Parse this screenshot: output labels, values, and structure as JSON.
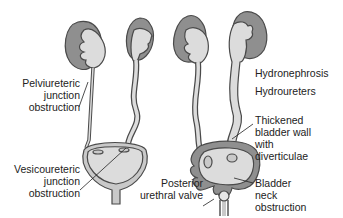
{
  "diagram": {
    "colors": {
      "cortex": "#8f8f8f",
      "pelvis": "#dcdcdc",
      "outline": "#4a4a4a",
      "text": "#222222",
      "background": "#ffffff"
    },
    "left_figure": {
      "labels": [
        {
          "id": "pui",
          "text": "Pelviureteric\njunction\nobstruction"
        },
        {
          "id": "vuj",
          "text": "Vesicoureteric\njunction\nobstruction"
        }
      ]
    },
    "right_figure": {
      "labels": [
        {
          "id": "hydronephrosis",
          "text": "Hydronephrosis"
        },
        {
          "id": "hydroureters",
          "text": "Hydroureters"
        },
        {
          "id": "thickened",
          "text": "Thickened\nbladder wall\nwith\ndiverticulae"
        },
        {
          "id": "posterior",
          "text": "Posterior\nurethral valve"
        },
        {
          "id": "neck",
          "text": "Bladder\nneck\nobstruction"
        }
      ]
    }
  }
}
